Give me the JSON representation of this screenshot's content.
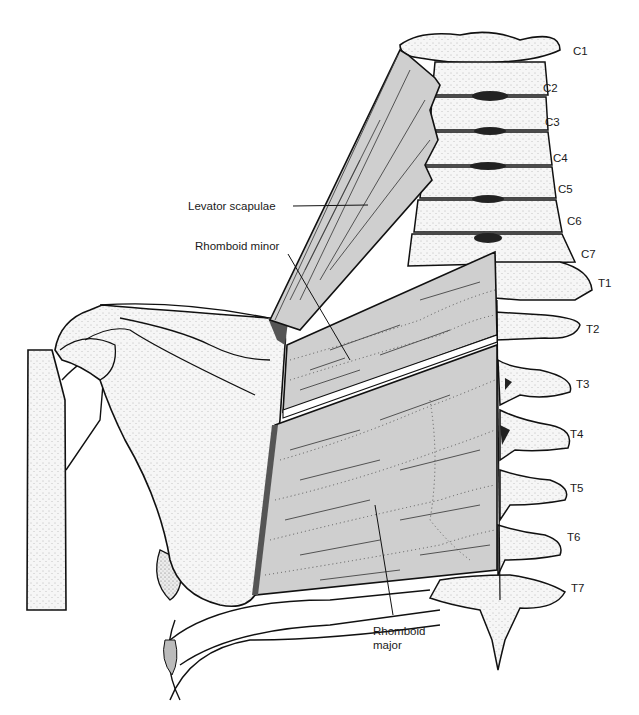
{
  "figure": {
    "colors": {
      "background": "#ffffff",
      "bone_fill": "#f4f4f4",
      "muscle_fill": "#cfcfcf",
      "outline": "#111111"
    }
  },
  "labels": {
    "levator_scapulae": "Levator scapulae",
    "rhomboid_minor": "Rhomboid minor",
    "rhomboid_major_line1": "Rhomboid",
    "rhomboid_major_line2": "major"
  },
  "vertebrae": [
    {
      "id": "C1",
      "label": "C1"
    },
    {
      "id": "C2",
      "label": "C2"
    },
    {
      "id": "C3",
      "label": "C3"
    },
    {
      "id": "C4",
      "label": "C4"
    },
    {
      "id": "C5",
      "label": "C5"
    },
    {
      "id": "C6",
      "label": "C6"
    },
    {
      "id": "C7",
      "label": "C7"
    },
    {
      "id": "T1",
      "label": "T1"
    },
    {
      "id": "T2",
      "label": "T2"
    },
    {
      "id": "T3",
      "label": "T3"
    },
    {
      "id": "T4",
      "label": "T4"
    },
    {
      "id": "T5",
      "label": "T5"
    },
    {
      "id": "T6",
      "label": "T6"
    },
    {
      "id": "T7",
      "label": "T7"
    }
  ]
}
